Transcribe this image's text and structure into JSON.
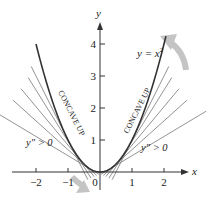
{
  "figure": {
    "function_label": "y = x",
    "function_exponent": "2",
    "axis_x_label": "x",
    "axis_y_label": "y",
    "x_ticks": [
      {
        "value": -2,
        "label": "−2"
      },
      {
        "value": -1,
        "label": "−1"
      },
      {
        "value": 0,
        "label": "0"
      },
      {
        "value": 1,
        "label": "1"
      },
      {
        "value": 2,
        "label": "2"
      }
    ],
    "y_ticks": [
      {
        "value": 1,
        "label": "1"
      },
      {
        "value": 2,
        "label": "2"
      },
      {
        "value": 3,
        "label": "3"
      },
      {
        "value": 4,
        "label": "4"
      }
    ],
    "left_region": {
      "concavity_label": "CONCAVE UP",
      "second_derivative_label": "y″ > 0"
    },
    "right_region": {
      "concavity_label": "CONCAVE UP",
      "second_derivative_label": "y″ > 0"
    },
    "left_tangent_points": [
      -1.0,
      -0.8,
      -0.6,
      -0.45,
      -0.3
    ],
    "right_tangent_points": [
      0.3,
      0.45,
      0.6,
      0.8,
      1.0
    ],
    "colors": {
      "curve": "#333333",
      "tangent": "#777777",
      "axis": "#333333",
      "arrow": "#bdbdbd"
    }
  }
}
